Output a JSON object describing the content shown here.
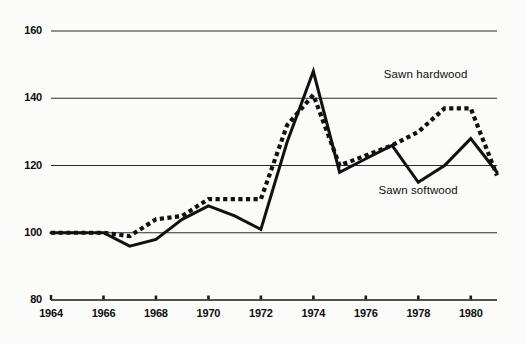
{
  "chart_data": {
    "type": "line",
    "title": "",
    "subtitle": "",
    "xlabel": "",
    "ylabel": "",
    "xlim": [
      1964,
      1981
    ],
    "ylim": [
      80,
      160
    ],
    "yticks": [
      80,
      100,
      120,
      140,
      160
    ],
    "xticks": [
      1964,
      1966,
      1968,
      1970,
      1972,
      1974,
      1976,
      1978,
      1980
    ],
    "grid": true,
    "gridlines_at": [
      100,
      120,
      140,
      160
    ],
    "legend_position": "inline-right",
    "x": [
      1964,
      1965,
      1966,
      1967,
      1968,
      1969,
      1970,
      1971,
      1972,
      1973,
      1974,
      1975,
      1976,
      1977,
      1978,
      1979,
      1980,
      1981
    ],
    "series": [
      {
        "name": "Sawn softwood",
        "style": "solid",
        "color": "#111111",
        "values": [
          100,
          100,
          100,
          96,
          98,
          104,
          108,
          105,
          101,
          127,
          148,
          118,
          122,
          126,
          115,
          120,
          128,
          118
        ]
      },
      {
        "name": "Sawn hardwood",
        "style": "dotted",
        "color": "#111111",
        "values": [
          100,
          100,
          100,
          99,
          104,
          105,
          110,
          110,
          110,
          132,
          141,
          120,
          123,
          126,
          130,
          137,
          137,
          117
        ]
      }
    ],
    "annotations": [
      {
        "text": "Sawn hardwood",
        "x": 1978.4,
        "y": 146.5
      },
      {
        "text": "Sawn softwood",
        "x": 1978.2,
        "y": 112.0
      }
    ]
  },
  "axes": {
    "y_tick_labels": [
      "160",
      "140",
      "120",
      "100",
      "80"
    ],
    "x_tick_labels": [
      "1964",
      "1966",
      "1968",
      "1970",
      "1972",
      "1974",
      "1976",
      "1978",
      "1980"
    ]
  },
  "colors": {
    "line": "#111111",
    "grid": "#2b2b2b",
    "axis": "#1a1a1a",
    "background": "#fbfbfa"
  }
}
